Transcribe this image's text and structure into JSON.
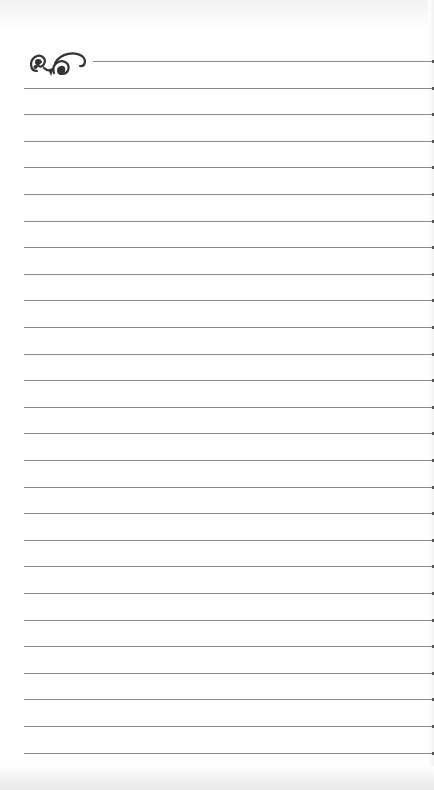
{
  "page": {
    "type": "lined-notebook-page",
    "background_color": "#ffffff",
    "rule_color": "#8a8a8a",
    "rule_count": 27,
    "first_rule_y": 61,
    "rule_spacing": 26.6,
    "rule_left": 24,
    "first_rule_left": 93
  },
  "ornament": {
    "icon": "flourish-ornament-icon",
    "color": "#333333"
  }
}
